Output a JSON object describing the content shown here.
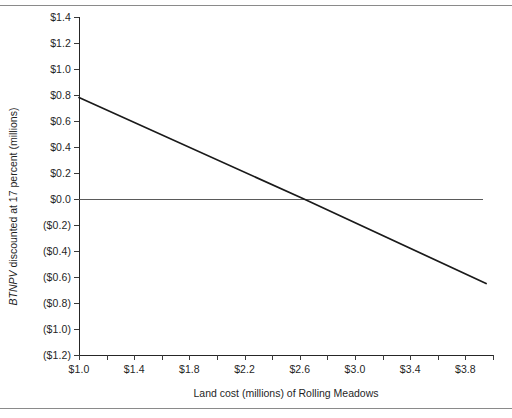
{
  "chart_data": {
    "type": "line",
    "title": "",
    "xlabel": "Land cost (millions) of Rolling Meadows",
    "ylabel_italic_prefix": "BTNPV",
    "ylabel_rest": " discounted at 17 percent (millions)",
    "ylabel_full": "BTNPV discounted at 17 percent (millions)",
    "xlim": [
      1.0,
      4.0
    ],
    "ylim": [
      -1.2,
      1.4
    ],
    "grid": false,
    "legend": "none",
    "x_tick_step": 0.2,
    "x_label_step": 0.4,
    "y_tick_step": 0.2,
    "x_tick_values": [
      1.0,
      1.2,
      1.4,
      1.6,
      1.8,
      2.0,
      2.2,
      2.4,
      2.6,
      2.8,
      3.0,
      3.2,
      3.4,
      3.6,
      3.8,
      4.0
    ],
    "x_tick_labels": [
      "$1.0",
      "",
      "$1.4",
      "",
      "$1.8",
      "",
      "$2.2",
      "",
      "$2.6",
      "",
      "$3.0",
      "",
      "$3.4",
      "",
      "$3.8",
      ""
    ],
    "y_tick_values": [
      1.4,
      1.2,
      1.0,
      0.8,
      0.6,
      0.4,
      0.2,
      0.0,
      -0.2,
      -0.4,
      -0.6,
      -0.8,
      -1.0,
      -1.2
    ],
    "y_tick_labels": [
      "$1.4",
      "$1.2",
      "$1.0",
      "$0.8",
      "$0.6",
      "$0.4",
      "$0.2",
      "$0.0",
      "($0.2)",
      "($0.4)",
      "($0.6)",
      "($0.8)",
      "($1.0)",
      "($1.2)"
    ],
    "zero_reference_line": {
      "value": 0.0,
      "x_start": 1.0,
      "x_end": 3.93,
      "color": "#5a5a5a"
    },
    "series": [
      {
        "name": "BTNPV vs land cost",
        "color": "#1a1a1a",
        "x": [
          1.0,
          3.95
        ],
        "values": [
          0.78,
          -0.65
        ],
        "points": [
          {
            "x": 1.0,
            "y": 0.78
          },
          {
            "x": 2.63,
            "y": 0.0
          },
          {
            "x": 3.95,
            "y": -0.65
          }
        ],
        "break_even_x": 2.63
      }
    ]
  }
}
